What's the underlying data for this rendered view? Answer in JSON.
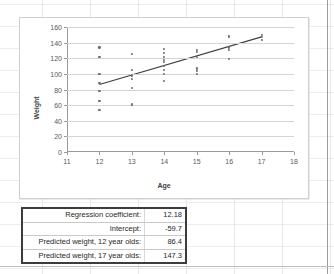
{
  "chart_data": {
    "type": "scatter",
    "title": "",
    "xlabel": "Age",
    "ylabel": "Weight",
    "xlim": [
      11,
      18
    ],
    "ylim": [
      0,
      160
    ],
    "xticks": [
      11,
      12,
      13,
      14,
      15,
      16,
      17,
      18
    ],
    "yticks": [
      0,
      20,
      40,
      60,
      80,
      100,
      120,
      140,
      160
    ],
    "grid": true,
    "legend": "none",
    "point_color": "#6b6b6b",
    "line_color": "#404040",
    "points": [
      {
        "x": 12,
        "y": 134
      },
      {
        "x": 12,
        "y": 122
      },
      {
        "x": 12,
        "y": 100
      },
      {
        "x": 12,
        "y": 88
      },
      {
        "x": 12,
        "y": 78
      },
      {
        "x": 12,
        "y": 65
      },
      {
        "x": 12,
        "y": 54
      },
      {
        "x": 13,
        "y": 126
      },
      {
        "x": 13,
        "y": 105
      },
      {
        "x": 13,
        "y": 98
      },
      {
        "x": 13,
        "y": 94
      },
      {
        "x": 13,
        "y": 82
      },
      {
        "x": 13,
        "y": 61
      },
      {
        "x": 14,
        "y": 132
      },
      {
        "x": 14,
        "y": 127
      },
      {
        "x": 14,
        "y": 122
      },
      {
        "x": 14,
        "y": 118
      },
      {
        "x": 14,
        "y": 115
      },
      {
        "x": 14,
        "y": 110
      },
      {
        "x": 14,
        "y": 105
      },
      {
        "x": 14,
        "y": 100
      },
      {
        "x": 14,
        "y": 91
      },
      {
        "x": 15,
        "y": 131
      },
      {
        "x": 15,
        "y": 128
      },
      {
        "x": 15,
        "y": 122
      },
      {
        "x": 15,
        "y": 107
      },
      {
        "x": 15,
        "y": 104
      },
      {
        "x": 15,
        "y": 100
      },
      {
        "x": 16,
        "y": 149
      },
      {
        "x": 16,
        "y": 147
      },
      {
        "x": 16,
        "y": 135
      },
      {
        "x": 16,
        "y": 133
      },
      {
        "x": 16,
        "y": 131
      },
      {
        "x": 16,
        "y": 119
      },
      {
        "x": 17,
        "y": 150
      },
      {
        "x": 17,
        "y": 147
      },
      {
        "x": 17,
        "y": 144
      }
    ],
    "trendline": {
      "x0": 12,
      "y0": 86.4,
      "x1": 17,
      "y1": 147.3
    }
  },
  "results": {
    "rows": [
      {
        "label": "Regression coefficient:",
        "value": "12.18"
      },
      {
        "label": "Intercept:",
        "value": "-59.7"
      },
      {
        "label": "Predicted weight, 12 year olds:",
        "value": "86.4"
      },
      {
        "label": "Predicted weight, 17 year olds:",
        "value": "147.3"
      }
    ]
  }
}
